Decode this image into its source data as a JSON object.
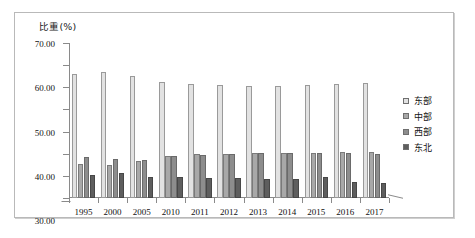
{
  "chart_data": {
    "type": "bar",
    "title": "",
    "ylabel": "比重(%)",
    "xlabel": "",
    "ylim": [
      0,
      70
    ],
    "yticks": [
      "0.00",
      "10.00",
      "20.00",
      "30.00",
      "40.00",
      "50.00",
      "60.00",
      "70.00"
    ],
    "grid": false,
    "legend_position": "right",
    "categories": [
      "1995",
      "2000",
      "2005",
      "2010",
      "2011",
      "2012",
      "2013",
      "2014",
      "2015",
      "2016",
      "2017"
    ],
    "series": [
      {
        "name": "东部",
        "color": "#e2e2e2",
        "values": [
          55.8,
          56.8,
          55.0,
          52.6,
          51.6,
          50.9,
          50.7,
          50.8,
          51.0,
          51.6,
          52.0
        ]
      },
      {
        "name": "中部",
        "color": "#a8a8a8",
        "values": [
          15.5,
          15.0,
          16.5,
          19.2,
          19.7,
          20.1,
          20.3,
          20.4,
          20.5,
          20.6,
          20.8
        ]
      },
      {
        "name": "西部",
        "color": "#8d8d8d",
        "values": [
          18.7,
          17.5,
          17.2,
          18.8,
          19.4,
          20.0,
          20.2,
          20.3,
          20.4,
          20.5,
          20.1
        ]
      },
      {
        "name": "东北",
        "color": "#5e5e5e",
        "values": [
          10.3,
          11.4,
          9.6,
          9.3,
          9.2,
          9.0,
          8.8,
          8.6,
          9.7,
          7.4,
          6.7
        ]
      }
    ]
  },
  "legend": {
    "items": [
      {
        "label": "东部"
      },
      {
        "label": "中部"
      },
      {
        "label": "西部"
      },
      {
        "label": "东北"
      }
    ]
  }
}
